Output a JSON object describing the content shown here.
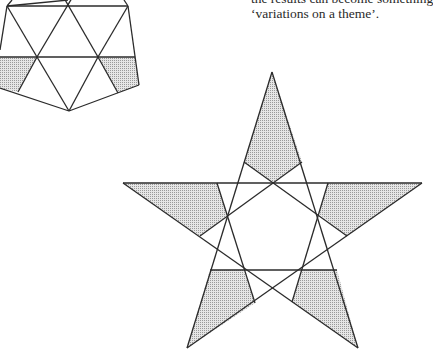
{
  "text": {
    "lines": [
      "the results can become something",
      "‘variations on a theme’."
    ]
  },
  "figures": {
    "hexagon_figure": {
      "description": "triangulated polygon with two shaded quadrilaterals",
      "shade_color": "#c8c8c8",
      "line_color": "#2b2b2b"
    },
    "star_figure": {
      "description": "pentagram with inner line pattern and five shaded regions",
      "shade_color": "#c8c8c8",
      "line_color": "#2b2b2b"
    }
  }
}
